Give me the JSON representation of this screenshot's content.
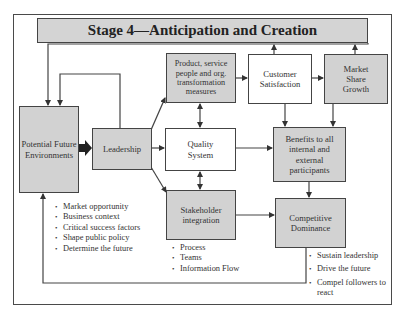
{
  "title": "Stage 4—Anticipation and Creation",
  "boxes": {
    "potential_future": "Potential Future Environments",
    "leadership": "Leadership",
    "product": "Product, service people and org. transformation measures",
    "customer": "Customer Satisfaction",
    "market": "Market Share Growth",
    "quality": "Quality System",
    "benefits": "Benefits to all internal and external participants",
    "stakeholder": "Stakeholder integration",
    "competitive": "Competitive Dominance"
  },
  "lists": {
    "environment_factors": [
      "Market opportunity",
      "Business context",
      "Critical success factors",
      "Shape public policy",
      "Determine the future"
    ],
    "stakeholder_items": [
      "Process",
      "Teams",
      "Information Flow"
    ],
    "dominance_outcomes": [
      "Sustain leadership",
      "Drive the future",
      "Compel followers to react"
    ]
  },
  "colors": {
    "box_fill": "#d2d2d2",
    "line": "#444444"
  }
}
